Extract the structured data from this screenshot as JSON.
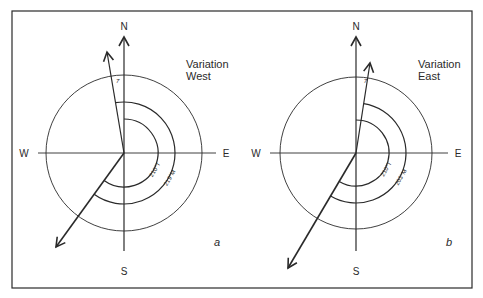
{
  "figure": {
    "frame": {
      "x": 12,
      "y": 11,
      "width": 460,
      "height": 277
    },
    "stroke_color": "#2a2a2a",
    "panels": [
      {
        "id": "a",
        "panel_label": "a",
        "variation_line1": "Variation",
        "variation_line2": "West",
        "cardinals": {
          "north": "N",
          "south": "S",
          "east": "E",
          "west": "W"
        },
        "center": [
          124,
          153
        ],
        "outer_radius": 78,
        "true_arc_radius": 34,
        "magnetic_arc_radius": 51,
        "magnetic_north_label": "7",
        "magnetic_north_tip": [
          107,
          52
        ],
        "course_tip": [
          56,
          247
        ],
        "true_bearing_label": "210°T",
        "magnetic_bearing_label": "219°M"
      },
      {
        "id": "b",
        "panel_label": "b",
        "variation_line1": "Variation",
        "variation_line2": "East",
        "cardinals": {
          "north": "N",
          "south": "S",
          "east": "E",
          "west": "W"
        },
        "center": [
          356,
          153
        ],
        "outer_radius": 76,
        "true_arc_radius": 33,
        "magnetic_arc_radius": 50,
        "magnetic_north_label": "7",
        "magnetic_north_tip": [
          370,
          63
        ],
        "course_tip": [
          288,
          268
        ],
        "true_bearing_label": "210°T",
        "magnetic_bearing_label": "203°M"
      }
    ]
  }
}
